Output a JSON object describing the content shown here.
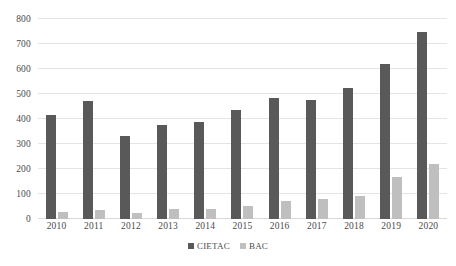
{
  "chart_data": {
    "type": "bar",
    "title": "",
    "subtitle": "",
    "xlabel": "",
    "ylabel": "",
    "categories": [
      "2010",
      "2011",
      "2012",
      "2013",
      "2014",
      "2015",
      "2016",
      "2017",
      "2018",
      "2019",
      "2020"
    ],
    "series": [
      {
        "name": "CIETAC",
        "color": "#595959",
        "values": [
          418,
          472,
          332,
          375,
          387,
          437,
          484,
          478,
          526,
          622,
          750
        ]
      },
      {
        "name": "BAC",
        "color": "#bfbfbf",
        "values": [
          28,
          38,
          25,
          42,
          42,
          53,
          72,
          82,
          94,
          168,
          220
        ]
      }
    ],
    "ylim": [
      0,
      800
    ],
    "ytick_values": [
      0,
      100,
      200,
      300,
      400,
      500,
      600,
      700,
      800
    ],
    "ytick_labels": [
      "0",
      "100",
      "200",
      "300",
      "400",
      "500",
      "600",
      "700",
      "800"
    ],
    "grid": true,
    "grid_axis": "y",
    "legend": {
      "position": "bottom",
      "entries": [
        {
          "label": "CIETAC",
          "color": "#595959"
        },
        {
          "label": "BAC",
          "color": "#bfbfbf"
        }
      ]
    },
    "background_color": "#ffffff",
    "gridline_color": "#e4e4e4",
    "axis_text_color": "#4a4a4a"
  }
}
